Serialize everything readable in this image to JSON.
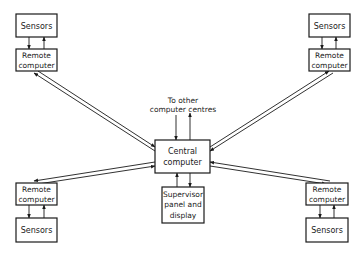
{
  "diagram": {
    "type": "network-block-diagram",
    "nodes": {
      "central": {
        "lines": [
          "Central",
          "computer"
        ]
      },
      "supervisor": {
        "lines": [
          "Supervisor",
          "panel and",
          "display"
        ]
      },
      "external_label": {
        "lines": [
          "To other",
          "computer centres"
        ]
      },
      "remote_tl": {
        "lines": [
          "Remote",
          "computer"
        ]
      },
      "remote_tr": {
        "lines": [
          "Remote",
          "computer"
        ]
      },
      "remote_bl": {
        "lines": [
          "Remote",
          "computer"
        ]
      },
      "remote_br": {
        "lines": [
          "Remote",
          "computer"
        ]
      },
      "sensors_tl": {
        "lines": [
          "Sensors"
        ]
      },
      "sensors_tr": {
        "lines": [
          "Sensors"
        ]
      },
      "sensors_bl": {
        "lines": [
          "Sensors"
        ]
      },
      "sensors_br": {
        "lines": [
          "Sensors"
        ]
      }
    },
    "edges": [
      {
        "from": "sensors_tl",
        "to": "remote_tl",
        "type": "bidirectional-pair"
      },
      {
        "from": "sensors_tr",
        "to": "remote_tr",
        "type": "bidirectional-pair"
      },
      {
        "from": "sensors_bl",
        "to": "remote_bl",
        "type": "bidirectional-pair"
      },
      {
        "from": "sensors_br",
        "to": "remote_br",
        "type": "bidirectional-pair"
      },
      {
        "from": "remote_tl",
        "to": "central",
        "type": "double-line-bidirectional"
      },
      {
        "from": "remote_tr",
        "to": "central",
        "type": "double-line-bidirectional"
      },
      {
        "from": "remote_bl",
        "to": "central",
        "type": "double-line-bidirectional"
      },
      {
        "from": "remote_br",
        "to": "central",
        "type": "double-line-bidirectional"
      },
      {
        "from": "central",
        "to": "external_label",
        "type": "bidirectional-pair"
      },
      {
        "from": "central",
        "to": "supervisor",
        "type": "bidirectional-pair"
      }
    ]
  }
}
